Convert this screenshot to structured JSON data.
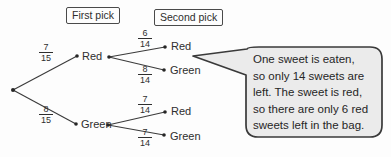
{
  "headers": {
    "first_pick": "First pick",
    "second_pick": "Second pick"
  },
  "tree": {
    "first_pick": {
      "red": {
        "label": "Red",
        "num": "7",
        "den": "15"
      },
      "green": {
        "label": "Green",
        "num": "8",
        "den": "15"
      }
    },
    "second_pick": {
      "after_red": {
        "red": {
          "label": "Red",
          "num": "6",
          "den": "14"
        },
        "green": {
          "label": "Green",
          "num": "8",
          "den": "14"
        }
      },
      "after_green": {
        "red": {
          "label": "Red",
          "num": "7",
          "den": "14"
        },
        "green": {
          "label": "Green",
          "num": "7",
          "den": "14"
        }
      }
    }
  },
  "callout": {
    "lines": [
      "One sweet is eaten,",
      "so only 14 sweets are",
      "left. The sweet is red,",
      "so there are only 6 red",
      "sweets left in the bag."
    ]
  },
  "colors": {
    "bubble_fill": "#ebebeb",
    "bubble_stroke": "#3a3a3a",
    "line": "#3a3a3a"
  }
}
